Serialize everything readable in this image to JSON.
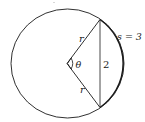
{
  "diagram": {
    "labels": {
      "radius_upper": "r",
      "radius_lower": "r",
      "angle": "θ",
      "chord": "2",
      "arc": "s = 3"
    },
    "colors": {
      "stroke": "#1a1a1a",
      "background": "#ffffff"
    }
  }
}
